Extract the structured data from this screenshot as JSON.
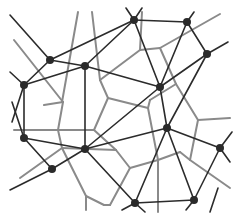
{
  "diagram": {
    "title": "",
    "colors": {
      "background": "#ffffff",
      "delaunay_edge": "#2b2b2b",
      "voronoi_edge": "#8a8a8a",
      "node": "#2a2a2a"
    },
    "nodes": [
      {
        "id": "A",
        "x": 50,
        "y": 60
      },
      {
        "id": "B",
        "x": 85,
        "y": 66
      },
      {
        "id": "C",
        "x": 24,
        "y": 85
      },
      {
        "id": "D",
        "x": 134,
        "y": 20
      },
      {
        "id": "E",
        "x": 187,
        "y": 22
      },
      {
        "id": "F",
        "x": 207,
        "y": 54
      },
      {
        "id": "G",
        "x": 160,
        "y": 87
      },
      {
        "id": "H",
        "x": 24,
        "y": 138
      },
      {
        "id": "I",
        "x": 85,
        "y": 149
      },
      {
        "id": "J",
        "x": 52,
        "y": 169
      },
      {
        "id": "K",
        "x": 167,
        "y": 128
      },
      {
        "id": "L",
        "x": 220,
        "y": 148
      },
      {
        "id": "M",
        "x": 135,
        "y": 203
      },
      {
        "id": "N",
        "x": 194,
        "y": 200
      }
    ],
    "delaunay_edges": [
      [
        "A",
        "B"
      ],
      [
        "A",
        "C"
      ],
      [
        "A",
        "D"
      ],
      [
        "B",
        "C"
      ],
      [
        "B",
        "D"
      ],
      [
        "B",
        "G"
      ],
      [
        "B",
        "I"
      ],
      [
        "D",
        "E"
      ],
      [
        "D",
        "G"
      ],
      [
        "E",
        "G"
      ],
      [
        "E",
        "F"
      ],
      [
        "F",
        "G"
      ],
      [
        "F",
        "K"
      ],
      [
        "G",
        "I"
      ],
      [
        "G",
        "K"
      ],
      [
        "C",
        "H"
      ],
      [
        "H",
        "I"
      ],
      [
        "H",
        "J"
      ],
      [
        "I",
        "J"
      ],
      [
        "I",
        "K"
      ],
      [
        "I",
        "M"
      ],
      [
        "K",
        "M"
      ],
      [
        "K",
        "N"
      ],
      [
        "K",
        "L"
      ],
      [
        "L",
        "N"
      ],
      [
        "M",
        "N"
      ]
    ],
    "delaunay_open_edges": [
      [
        10,
        15,
        50,
        60
      ],
      [
        10,
        72,
        24,
        85
      ],
      [
        12,
        122,
        24,
        85
      ],
      [
        12,
        102,
        24,
        138
      ],
      [
        10,
        190,
        52,
        169
      ],
      [
        126,
        8,
        134,
        20
      ],
      [
        142,
        8,
        134,
        20
      ],
      [
        194,
        12,
        187,
        22
      ],
      [
        228,
        42,
        207,
        54
      ],
      [
        232,
        132,
        220,
        148
      ],
      [
        230,
        162,
        220,
        148
      ],
      [
        186,
        210,
        194,
        200
      ],
      [
        145,
        212,
        135,
        203
      ],
      [
        122,
        210,
        135,
        203
      ],
      [
        218,
        188,
        210,
        212
      ]
    ],
    "voronoi_edges": [
      [
        62,
        102,
        78,
        12
      ],
      [
        63,
        102,
        44,
        105
      ],
      [
        63,
        102,
        14,
        40
      ],
      [
        63,
        102,
        58,
        130
      ],
      [
        58,
        130,
        14,
        130
      ],
      [
        58,
        130,
        94,
        130
      ],
      [
        58,
        130,
        62,
        148
      ],
      [
        94,
        130,
        108,
        98
      ],
      [
        94,
        130,
        116,
        150
      ],
      [
        108,
        98,
        100,
        80
      ],
      [
        108,
        98,
        148,
        108
      ],
      [
        100,
        80,
        92,
        12
      ],
      [
        100,
        80,
        140,
        50
      ],
      [
        140,
        50,
        160,
        48
      ],
      [
        140,
        50,
        142,
        12
      ],
      [
        160,
        48,
        220,
        14
      ],
      [
        160,
        48,
        176,
        84
      ],
      [
        176,
        84,
        198,
        120
      ],
      [
        176,
        84,
        150,
        100
      ],
      [
        148,
        108,
        150,
        100
      ],
      [
        148,
        108,
        158,
        160
      ],
      [
        198,
        120,
        230,
        118
      ],
      [
        198,
        120,
        190,
        160
      ],
      [
        158,
        160,
        180,
        152
      ],
      [
        158,
        160,
        130,
        168
      ],
      [
        158,
        160,
        158,
        212
      ],
      [
        180,
        152,
        190,
        160
      ],
      [
        190,
        160,
        230,
        188
      ],
      [
        130,
        168,
        116,
        150
      ],
      [
        130,
        168,
        110,
        205
      ],
      [
        62,
        148,
        20,
        178
      ],
      [
        62,
        148,
        116,
        150
      ],
      [
        62,
        148,
        86,
        196
      ],
      [
        86,
        196,
        104,
        205
      ],
      [
        86,
        196,
        86,
        210
      ],
      [
        104,
        205,
        110,
        205
      ]
    ]
  }
}
